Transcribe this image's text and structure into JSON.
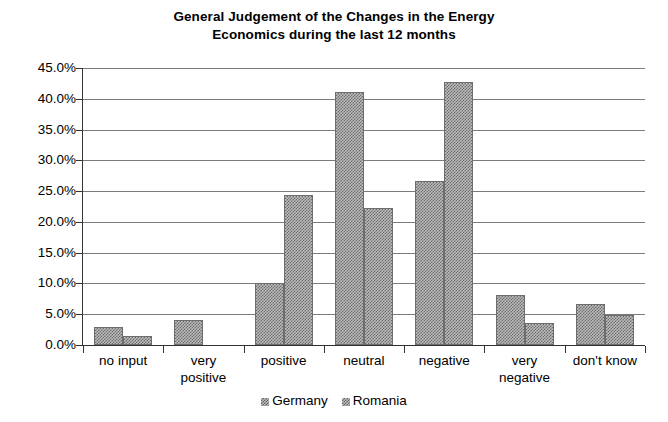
{
  "chart_data": {
    "type": "bar",
    "title": "General Judgement of the Changes in the Energy Economics during the last 12 months",
    "title_lines": [
      "General Judgement of the Changes in the Energy",
      "Economics during the last 12 months"
    ],
    "xlabel": "",
    "ylabel": "",
    "ylim": [
      0,
      45
    ],
    "ytick_step": 5,
    "grid": true,
    "legend_position": "bottom",
    "categories": [
      "no input",
      "very positive",
      "positive",
      "neutral",
      "negative",
      "very negative",
      "don't know"
    ],
    "category_label_lines": [
      [
        "no input"
      ],
      [
        "very",
        "positive"
      ],
      [
        "positive"
      ],
      [
        "neutral"
      ],
      [
        "negative"
      ],
      [
        "very",
        "negative"
      ],
      [
        "don't know"
      ]
    ],
    "ytick_labels": [
      "0.0%",
      "5.0%",
      "10.0%",
      "15.0%",
      "20.0%",
      "25.0%",
      "30.0%",
      "35.0%",
      "40.0%",
      "45.0%"
    ],
    "ytick_values": [
      0,
      5,
      10,
      15,
      20,
      25,
      30,
      35,
      40,
      45
    ],
    "series": [
      {
        "name": "Germany",
        "values": [
          3.0,
          4.1,
          10.0,
          41.1,
          26.6,
          8.2,
          6.6
        ]
      },
      {
        "name": "Romania",
        "values": [
          1.5,
          0.0,
          24.3,
          22.2,
          42.8,
          3.6,
          4.8
        ]
      }
    ],
    "colors": {
      "gridline": "#7b7b7b",
      "axis": "#333333",
      "bar_fill": "#b9b9b9",
      "bar_pattern": "#6e6e6e",
      "background": "#ffffff",
      "text": "#000000"
    }
  }
}
